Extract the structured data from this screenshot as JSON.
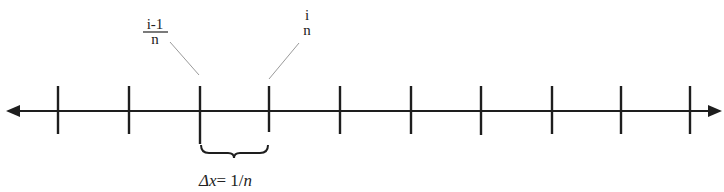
{
  "diagram": {
    "type": "number-line",
    "colors": {
      "line": "#1e1e1e",
      "leader": "#9a9a9a",
      "text": "#222222"
    },
    "axis": {
      "y": 111,
      "x_start": 6,
      "x_end": 722,
      "arrows": "both"
    },
    "ticks": [
      58,
      129,
      200,
      269,
      340,
      411,
      481,
      552,
      621,
      690
    ],
    "labels": {
      "left_point": {
        "numerator": "i-1",
        "denominator": "n"
      },
      "right_point": {
        "top": "i",
        "bottom": "n"
      }
    },
    "interval": {
      "from_tick": 2,
      "to_tick": 3,
      "label_symbol": "Δx",
      "label_eq": "= 1/",
      "label_var": "n"
    }
  }
}
